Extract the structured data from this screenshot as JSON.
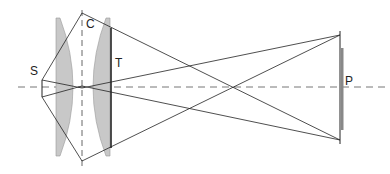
{
  "diagram": {
    "type": "optical-ray-diagram",
    "labels": {
      "source": "S",
      "center": "C",
      "lens_edge": "T",
      "plate": "P"
    },
    "colors": {
      "line": "#222222",
      "lens_fill": "#c8c8c8",
      "axis": "#777777"
    }
  }
}
